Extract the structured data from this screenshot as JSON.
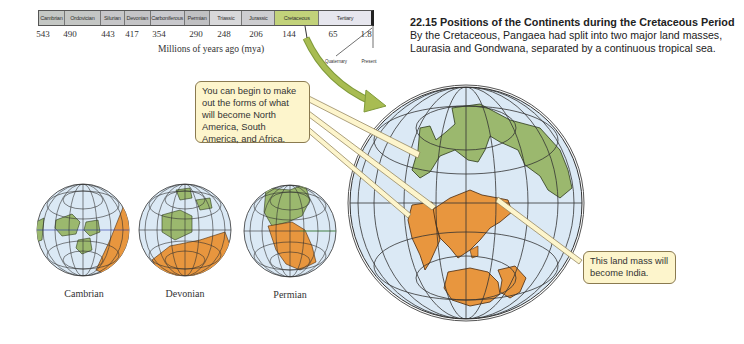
{
  "timeline": {
    "periods": [
      {
        "name": "Cambrian",
        "color": "#c4c7c4",
        "width": 26
      },
      {
        "name": "Ordovician",
        "color": "#c4c6c4",
        "width": 36
      },
      {
        "name": "Silurian",
        "color": "#c6c6c8",
        "width": 24
      },
      {
        "name": "Devonian",
        "color": "#c4c4c6",
        "width": 26
      },
      {
        "name": "Carboniferous",
        "color": "#c8c8cc",
        "width": 34
      },
      {
        "name": "Permian",
        "color": "#c0c0c2",
        "width": 26
      },
      {
        "name": "Triassic",
        "color": "#d8d8da",
        "width": 32
      },
      {
        "name": "Jurassic",
        "color": "#cdcdd0",
        "width": 33
      },
      {
        "name": "Cretaceous",
        "color": "#c2d27a",
        "width": 44
      },
      {
        "name": "Tertiary",
        "color": "#e6e6ee",
        "width": 52
      }
    ],
    "ticks": [
      {
        "label": "543",
        "x": 43
      },
      {
        "label": "490",
        "x": 70
      },
      {
        "label": "443",
        "x": 108
      },
      {
        "label": "417",
        "x": 132
      },
      {
        "label": "354",
        "x": 159
      },
      {
        "label": "290",
        "x": 196
      },
      {
        "label": "248",
        "x": 224
      },
      {
        "label": "206",
        "x": 256
      },
      {
        "label": "144",
        "x": 289
      },
      {
        "label": "65",
        "x": 333
      },
      {
        "label": "1.8",
        "x": 366
      }
    ],
    "axis_label": "Millions of years ago (mya)",
    "quaternary_label": "Quaternary",
    "present_label": "Present",
    "highlight_color": "#a8bc52"
  },
  "caption": {
    "title": "22.15  Positions of the Continents during the Cretaceous Period",
    "body": "By the Cretaceous, Pangaea had split into two major land masses, Laurasia and Gondwana, separated by a continuous tropical sea."
  },
  "callouts": {
    "continents": "You can begin to make out the forms of what will become North America, South America, and Africa.",
    "india": "This land mass will become India."
  },
  "globes": [
    {
      "label": "Cambrian"
    },
    {
      "label": "Devonian"
    },
    {
      "label": "Permian"
    }
  ],
  "colors": {
    "ocean": "#dbe9f5",
    "laurasia": "#9bb86e",
    "gondwana": "#e8963e",
    "grid": "#333333",
    "callout_fill": "#fdf5cc"
  }
}
